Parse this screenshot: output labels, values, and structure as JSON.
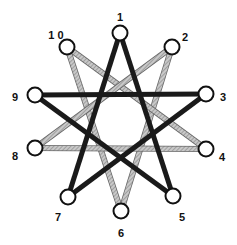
{
  "diagram": {
    "title": "",
    "nodes": [
      {
        "id": "1",
        "label": "1",
        "x": 120,
        "y": 33,
        "lx": 120,
        "ly": 18
      },
      {
        "id": "2",
        "label": "2",
        "x": 172,
        "y": 47,
        "lx": 185,
        "ly": 38
      },
      {
        "id": "3",
        "label": "3",
        "x": 206,
        "y": 94,
        "lx": 223,
        "ly": 98
      },
      {
        "id": "4",
        "label": "4",
        "x": 206,
        "y": 149,
        "lx": 222,
        "ly": 158
      },
      {
        "id": "5",
        "label": "5",
        "x": 173,
        "y": 196,
        "lx": 182,
        "ly": 218
      },
      {
        "id": "6",
        "label": "6",
        "x": 121,
        "y": 211,
        "lx": 121,
        "ly": 234
      },
      {
        "id": "7",
        "label": "7",
        "x": 68,
        "y": 197,
        "lx": 58,
        "ly": 218
      },
      {
        "id": "8",
        "label": "8",
        "x": 35,
        "y": 148,
        "lx": 15,
        "ly": 157
      },
      {
        "id": "9",
        "label": "9",
        "x": 35,
        "y": 95,
        "lx": 15,
        "ly": 98
      },
      {
        "id": "10",
        "label": "1 0",
        "x": 67,
        "y": 47,
        "lx": 56,
        "ly": 36
      }
    ],
    "edges_black": [
      [
        "1",
        "5"
      ],
      [
        "5",
        "9"
      ],
      [
        "9",
        "3"
      ],
      [
        "3",
        "7"
      ],
      [
        "7",
        "1"
      ]
    ],
    "edges_gray": [
      [
        "2",
        "6"
      ],
      [
        "6",
        "10"
      ],
      [
        "10",
        "4"
      ],
      [
        "4",
        "8"
      ],
      [
        "8",
        "2"
      ]
    ],
    "colors": {
      "black_edge": "#1a1a1a",
      "gray_edge": "#a8a8a8",
      "node_fill": "#ffffff",
      "node_stroke": "#111111"
    }
  }
}
